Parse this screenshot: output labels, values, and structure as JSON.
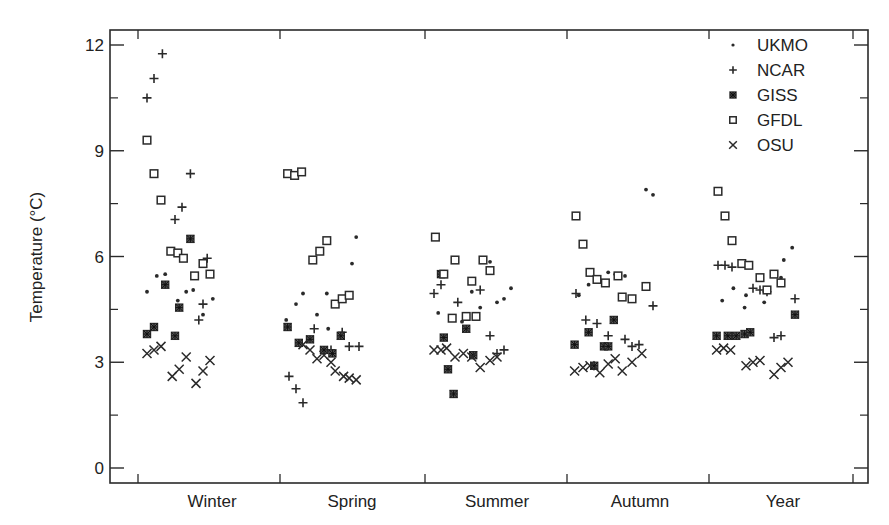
{
  "chart_data": {
    "type": "scatter",
    "title": "",
    "xlabel": "",
    "ylabel": "Temperature (°C)",
    "ylim": [
      -0.4,
      12.8
    ],
    "yticks": [
      0,
      3,
      6,
      9,
      12
    ],
    "yminor": [
      1.5,
      4.5,
      7.5,
      10.5
    ],
    "categories": [
      "Winter",
      "Spring",
      "Summer",
      "Autumn",
      "Year"
    ],
    "grid": false,
    "legend_position": "top-right",
    "series": [
      {
        "name": "UKMO",
        "marker": "dot",
        "points": [
          [
            "Winter",
            0.05,
            5.0
          ],
          [
            "Winter",
            0.12,
            5.45
          ],
          [
            "Winter",
            0.18,
            5.5
          ],
          [
            "Winter",
            0.27,
            4.75
          ],
          [
            "Winter",
            0.33,
            5.0
          ],
          [
            "Winter",
            0.38,
            5.05
          ],
          [
            "Winter",
            0.45,
            4.35
          ],
          [
            "Winter",
            0.52,
            4.8
          ],
          [
            "Spring",
            0.03,
            4.2
          ],
          [
            "Spring",
            0.1,
            4.65
          ],
          [
            "Spring",
            0.15,
            4.95
          ],
          [
            "Spring",
            0.25,
            4.35
          ],
          [
            "Spring",
            0.32,
            4.95
          ],
          [
            "Spring",
            0.5,
            5.8
          ],
          [
            "Spring",
            0.53,
            6.55
          ],
          [
            "Spring",
            0.33,
            3.95
          ],
          [
            "Summer",
            0.08,
            4.4
          ],
          [
            "Summer",
            0.25,
            4.15
          ],
          [
            "Summer",
            0.32,
            5.0
          ],
          [
            "Summer",
            0.38,
            4.55
          ],
          [
            "Summer",
            0.45,
            5.85
          ],
          [
            "Summer",
            0.5,
            4.7
          ],
          [
            "Summer",
            0.55,
            4.8
          ],
          [
            "Summer",
            0.6,
            5.1
          ],
          [
            "Autumn",
            0.07,
            4.9
          ],
          [
            "Autumn",
            0.14,
            5.2
          ],
          [
            "Autumn",
            0.22,
            5.3
          ],
          [
            "Autumn",
            0.28,
            5.55
          ],
          [
            "Autumn",
            0.33,
            5.5
          ],
          [
            "Autumn",
            0.4,
            5.45
          ],
          [
            "Autumn",
            0.55,
            7.9
          ],
          [
            "Autumn",
            0.6,
            7.75
          ],
          [
            "Year",
            0.08,
            4.75
          ],
          [
            "Year",
            0.16,
            5.1
          ],
          [
            "Year",
            0.25,
            4.9
          ],
          [
            "Year",
            0.38,
            4.7
          ],
          [
            "Year",
            0.5,
            5.4
          ],
          [
            "Year",
            0.52,
            5.9
          ],
          [
            "Year",
            0.58,
            6.25
          ],
          [
            "Year",
            0.24,
            4.55
          ]
        ]
      },
      {
        "name": "NCAR",
        "marker": "plus",
        "points": [
          [
            "Winter",
            0.05,
            10.5
          ],
          [
            "Winter",
            0.1,
            11.05
          ],
          [
            "Winter",
            0.16,
            11.75
          ],
          [
            "Winter",
            0.36,
            8.35
          ],
          [
            "Winter",
            0.3,
            7.4
          ],
          [
            "Winter",
            0.25,
            7.05
          ],
          [
            "Winter",
            0.48,
            5.95
          ],
          [
            "Winter",
            0.45,
            4.65
          ],
          [
            "Winter",
            0.42,
            4.2
          ],
          [
            "Spring",
            0.05,
            2.6
          ],
          [
            "Spring",
            0.1,
            2.25
          ],
          [
            "Spring",
            0.15,
            1.85
          ],
          [
            "Spring",
            0.23,
            3.95
          ],
          [
            "Spring",
            0.35,
            3.35
          ],
          [
            "Spring",
            0.43,
            3.85
          ],
          [
            "Spring",
            0.48,
            3.45
          ],
          [
            "Spring",
            0.55,
            3.45
          ],
          [
            "Summer",
            0.05,
            4.95
          ],
          [
            "Summer",
            0.1,
            5.2
          ],
          [
            "Summer",
            0.22,
            4.7
          ],
          [
            "Summer",
            0.38,
            5.05
          ],
          [
            "Summer",
            0.45,
            3.75
          ],
          [
            "Summer",
            0.5,
            3.25
          ],
          [
            "Summer",
            0.55,
            3.35
          ],
          [
            "Autumn",
            0.05,
            4.95
          ],
          [
            "Autumn",
            0.12,
            4.2
          ],
          [
            "Autumn",
            0.2,
            4.1
          ],
          [
            "Autumn",
            0.28,
            3.75
          ],
          [
            "Autumn",
            0.4,
            3.65
          ],
          [
            "Autumn",
            0.45,
            3.45
          ],
          [
            "Autumn",
            0.5,
            3.5
          ],
          [
            "Autumn",
            0.6,
            4.6
          ],
          [
            "Year",
            0.05,
            5.75
          ],
          [
            "Year",
            0.1,
            5.75
          ],
          [
            "Year",
            0.15,
            5.7
          ],
          [
            "Year",
            0.3,
            5.1
          ],
          [
            "Year",
            0.35,
            5.05
          ],
          [
            "Year",
            0.4,
            5.0
          ],
          [
            "Year",
            0.45,
            3.7
          ],
          [
            "Year",
            0.5,
            3.75
          ],
          [
            "Year",
            0.6,
            4.8
          ]
        ]
      },
      {
        "name": "GISS",
        "marker": "asterisk-box",
        "points": [
          [
            "Winter",
            0.05,
            3.8
          ],
          [
            "Winter",
            0.1,
            4.0
          ],
          [
            "Winter",
            0.18,
            5.2
          ],
          [
            "Winter",
            0.25,
            3.75
          ],
          [
            "Winter",
            0.28,
            4.55
          ],
          [
            "Winter",
            0.36,
            6.5
          ],
          [
            "Spring",
            0.04,
            4.0
          ],
          [
            "Spring",
            0.12,
            3.55
          ],
          [
            "Spring",
            0.2,
            3.65
          ],
          [
            "Spring",
            0.3,
            3.35
          ],
          [
            "Spring",
            0.36,
            3.25
          ],
          [
            "Spring",
            0.42,
            3.75
          ],
          [
            "Summer",
            0.1,
            5.5
          ],
          [
            "Summer",
            0.12,
            3.7
          ],
          [
            "Summer",
            0.15,
            2.8
          ],
          [
            "Summer",
            0.19,
            2.1
          ],
          [
            "Summer",
            0.28,
            3.95
          ],
          [
            "Summer",
            0.33,
            3.2
          ],
          [
            "Autumn",
            0.04,
            3.5
          ],
          [
            "Autumn",
            0.14,
            3.85
          ],
          [
            "Autumn",
            0.18,
            2.9
          ],
          [
            "Autumn",
            0.25,
            3.45
          ],
          [
            "Autumn",
            0.28,
            3.45
          ],
          [
            "Autumn",
            0.32,
            4.2
          ],
          [
            "Year",
            0.04,
            3.75
          ],
          [
            "Year",
            0.12,
            3.75
          ],
          [
            "Year",
            0.18,
            3.75
          ],
          [
            "Year",
            0.24,
            3.8
          ],
          [
            "Year",
            0.28,
            3.85
          ],
          [
            "Year",
            0.6,
            4.35
          ]
        ]
      },
      {
        "name": "GFDL",
        "marker": "square",
        "points": [
          [
            "Winter",
            0.05,
            9.3
          ],
          [
            "Winter",
            0.1,
            8.35
          ],
          [
            "Winter",
            0.15,
            7.6
          ],
          [
            "Winter",
            0.22,
            6.15
          ],
          [
            "Winter",
            0.27,
            6.1
          ],
          [
            "Winter",
            0.31,
            5.95
          ],
          [
            "Winter",
            0.39,
            5.45
          ],
          [
            "Winter",
            0.45,
            5.8
          ],
          [
            "Winter",
            0.5,
            5.5
          ],
          [
            "Spring",
            0.04,
            8.35
          ],
          [
            "Spring",
            0.09,
            8.3
          ],
          [
            "Spring",
            0.14,
            8.4
          ],
          [
            "Spring",
            0.22,
            5.9
          ],
          [
            "Spring",
            0.27,
            6.15
          ],
          [
            "Spring",
            0.32,
            6.45
          ],
          [
            "Spring",
            0.38,
            4.65
          ],
          [
            "Spring",
            0.43,
            4.8
          ],
          [
            "Spring",
            0.48,
            4.9
          ],
          [
            "Summer",
            0.06,
            6.55
          ],
          [
            "Summer",
            0.2,
            5.9
          ],
          [
            "Summer",
            0.4,
            5.9
          ],
          [
            "Summer",
            0.45,
            5.6
          ],
          [
            "Summer",
            0.32,
            5.3
          ],
          [
            "Summer",
            0.35,
            4.3
          ],
          [
            "Summer",
            0.18,
            4.25
          ],
          [
            "Summer",
            0.28,
            4.3
          ],
          [
            "Summer",
            0.12,
            5.5
          ],
          [
            "Autumn",
            0.05,
            7.15
          ],
          [
            "Autumn",
            0.1,
            6.35
          ],
          [
            "Autumn",
            0.15,
            5.55
          ],
          [
            "Autumn",
            0.2,
            5.35
          ],
          [
            "Autumn",
            0.26,
            5.25
          ],
          [
            "Autumn",
            0.35,
            5.45
          ],
          [
            "Autumn",
            0.38,
            4.85
          ],
          [
            "Autumn",
            0.45,
            4.8
          ],
          [
            "Autumn",
            0.55,
            5.15
          ],
          [
            "Year",
            0.05,
            7.85
          ],
          [
            "Year",
            0.1,
            7.15
          ],
          [
            "Year",
            0.15,
            6.45
          ],
          [
            "Year",
            0.22,
            5.8
          ],
          [
            "Year",
            0.27,
            5.75
          ],
          [
            "Year",
            0.35,
            5.4
          ],
          [
            "Year",
            0.4,
            5.05
          ],
          [
            "Year",
            0.45,
            5.5
          ],
          [
            "Year",
            0.5,
            5.25
          ]
        ]
      },
      {
        "name": "OSU",
        "marker": "x",
        "points": [
          [
            "Winter",
            0.05,
            3.25
          ],
          [
            "Winter",
            0.1,
            3.35
          ],
          [
            "Winter",
            0.15,
            3.45
          ],
          [
            "Winter",
            0.23,
            2.6
          ],
          [
            "Winter",
            0.28,
            2.8
          ],
          [
            "Winter",
            0.33,
            3.15
          ],
          [
            "Winter",
            0.4,
            2.4
          ],
          [
            "Winter",
            0.45,
            2.75
          ],
          [
            "Winter",
            0.5,
            3.05
          ],
          [
            "Spring",
            0.15,
            3.5
          ],
          [
            "Spring",
            0.2,
            3.35
          ],
          [
            "Spring",
            0.25,
            3.1
          ],
          [
            "Spring",
            0.3,
            3.2
          ],
          [
            "Spring",
            0.35,
            3.0
          ],
          [
            "Spring",
            0.38,
            2.75
          ],
          [
            "Spring",
            0.44,
            2.6
          ],
          [
            "Spring",
            0.48,
            2.55
          ],
          [
            "Spring",
            0.53,
            2.5
          ],
          [
            "Summer",
            0.05,
            3.35
          ],
          [
            "Summer",
            0.1,
            3.35
          ],
          [
            "Summer",
            0.14,
            3.4
          ],
          [
            "Summer",
            0.2,
            3.15
          ],
          [
            "Summer",
            0.26,
            3.25
          ],
          [
            "Summer",
            0.32,
            3.15
          ],
          [
            "Summer",
            0.38,
            2.85
          ],
          [
            "Summer",
            0.45,
            3.05
          ],
          [
            "Summer",
            0.5,
            3.15
          ],
          [
            "Autumn",
            0.04,
            2.75
          ],
          [
            "Autumn",
            0.1,
            2.85
          ],
          [
            "Autumn",
            0.15,
            2.9
          ],
          [
            "Autumn",
            0.22,
            2.7
          ],
          [
            "Autumn",
            0.28,
            2.95
          ],
          [
            "Autumn",
            0.33,
            3.1
          ],
          [
            "Autumn",
            0.38,
            2.75
          ],
          [
            "Autumn",
            0.45,
            3.0
          ],
          [
            "Autumn",
            0.52,
            3.25
          ],
          [
            "Year",
            0.04,
            3.35
          ],
          [
            "Year",
            0.09,
            3.4
          ],
          [
            "Year",
            0.14,
            3.35
          ],
          [
            "Year",
            0.25,
            2.9
          ],
          [
            "Year",
            0.3,
            3.0
          ],
          [
            "Year",
            0.35,
            3.05
          ],
          [
            "Year",
            0.45,
            2.65
          ],
          [
            "Year",
            0.5,
            2.85
          ],
          [
            "Year",
            0.55,
            3.0
          ]
        ]
      }
    ]
  },
  "layout": {
    "plot": {
      "left": 110,
      "right": 868,
      "top": 30,
      "bottom": 483
    },
    "y_px_per_unit": 35.25,
    "y_zero_px": 468,
    "x_ticks_px": [
      138,
      280,
      425,
      567,
      709,
      853
    ],
    "category_start_px": [
      140,
      282,
      427,
      569,
      711
    ],
    "category_span_px": 140,
    "category_label_px": [
      212,
      352,
      497,
      640,
      783
    ],
    "ink_color": "#2a2a2a"
  },
  "legend": {
    "items": [
      {
        "label": "UKMO",
        "marker": "dot"
      },
      {
        "label": "NCAR",
        "marker": "plus"
      },
      {
        "label": "GISS",
        "marker": "asterisk-box"
      },
      {
        "label": "GFDL",
        "marker": "square"
      },
      {
        "label": "OSU",
        "marker": "x"
      }
    ]
  }
}
